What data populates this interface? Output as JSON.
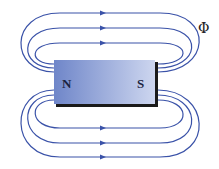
{
  "diagram": {
    "labels": {
      "north": "N",
      "south": "S",
      "flux_symbol": "Φ"
    },
    "colors": {
      "field_line": "#3a52a8",
      "magnet_left": "#6f86c9",
      "magnet_right": "#c8d2ee",
      "shadow": "#1a1a1a"
    },
    "field_lines_count": 6
  }
}
